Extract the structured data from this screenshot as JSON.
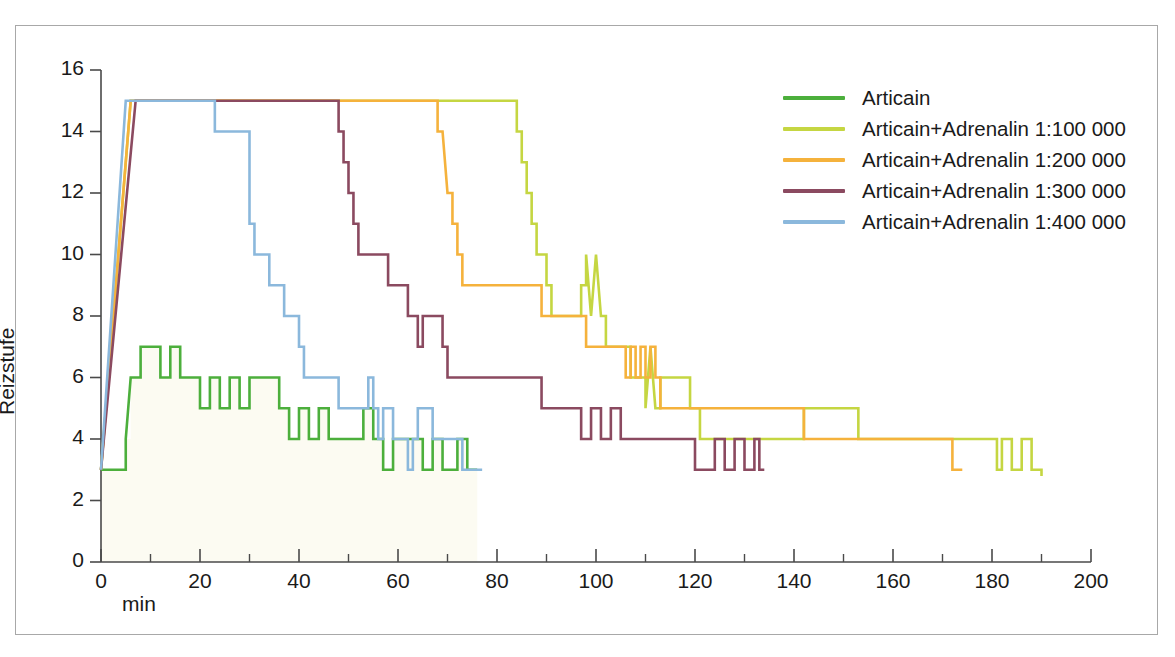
{
  "chart_data": {
    "type": "line",
    "title": "",
    "xlabel": "min",
    "ylabel": "Reizstufe",
    "xlim": [
      0,
      200
    ],
    "ylim": [
      0,
      16
    ],
    "xticks": [
      0,
      20,
      40,
      60,
      80,
      100,
      120,
      140,
      160,
      180,
      200
    ],
    "yticks": [
      0,
      2,
      4,
      6,
      8,
      10,
      12,
      14,
      16
    ],
    "xtick_labels": [
      "0",
      "20",
      "40",
      "60",
      "80",
      "100",
      "120",
      "140",
      "160",
      "180",
      "200"
    ],
    "ytick_labels": [
      "0",
      "2",
      "4",
      "6",
      "8",
      "10",
      "12",
      "14",
      "16"
    ],
    "x_minor_tick_step": 10,
    "grid": false,
    "legend_position": "upper-right",
    "series": [
      {
        "name": "Articain",
        "color": "#4CAF3C",
        "points": [
          [
            0,
            3
          ],
          [
            4,
            3
          ],
          [
            5,
            4
          ],
          [
            6,
            6
          ],
          [
            7,
            6
          ],
          [
            8,
            7
          ],
          [
            11,
            7
          ],
          [
            12,
            6
          ],
          [
            13,
            6
          ],
          [
            14,
            7
          ],
          [
            15,
            7
          ],
          [
            16,
            6
          ],
          [
            19,
            6
          ],
          [
            20,
            5
          ],
          [
            21,
            5
          ],
          [
            22,
            6
          ],
          [
            23,
            6
          ],
          [
            24,
            5
          ],
          [
            25,
            5
          ],
          [
            26,
            6
          ],
          [
            27,
            6
          ],
          [
            28,
            5
          ],
          [
            29,
            5
          ],
          [
            30,
            6
          ],
          [
            35,
            6
          ],
          [
            36,
            5
          ],
          [
            37,
            5
          ],
          [
            38,
            4
          ],
          [
            39,
            4
          ],
          [
            40,
            5
          ],
          [
            41,
            5
          ],
          [
            42,
            4
          ],
          [
            43,
            4
          ],
          [
            44,
            5
          ],
          [
            45,
            5
          ],
          [
            46,
            4
          ],
          [
            52,
            4
          ],
          [
            53,
            5
          ],
          [
            54,
            5
          ],
          [
            55,
            4
          ],
          [
            56,
            4
          ],
          [
            57,
            3
          ],
          [
            58,
            3
          ],
          [
            59,
            4
          ],
          [
            64,
            4
          ],
          [
            65,
            3
          ],
          [
            66,
            3
          ],
          [
            67,
            4
          ],
          [
            68,
            4
          ],
          [
            69,
            3
          ],
          [
            71,
            3
          ],
          [
            72,
            4
          ],
          [
            73,
            4
          ],
          [
            74,
            3
          ],
          [
            76,
            3
          ]
        ]
      },
      {
        "name": "Articain+Adrenalin 1:100 000",
        "color": "#C5D642",
        "points": [
          [
            0,
            3
          ],
          [
            6,
            15
          ],
          [
            83,
            15
          ],
          [
            84,
            14
          ],
          [
            85,
            13
          ],
          [
            86,
            12
          ],
          [
            87,
            11
          ],
          [
            88,
            10
          ],
          [
            89,
            10
          ],
          [
            90,
            9
          ],
          [
            91,
            8
          ],
          [
            96,
            8
          ],
          [
            97,
            9
          ],
          [
            98,
            10
          ],
          [
            99,
            8
          ],
          [
            100,
            10
          ],
          [
            101,
            8
          ],
          [
            102,
            7
          ],
          [
            106,
            7
          ],
          [
            107,
            6
          ],
          [
            109,
            6
          ],
          [
            110,
            5
          ],
          [
            111,
            7
          ],
          [
            112,
            5
          ],
          [
            113,
            6
          ],
          [
            118,
            6
          ],
          [
            119,
            5
          ],
          [
            120,
            5
          ],
          [
            121,
            4
          ],
          [
            141,
            4
          ],
          [
            142,
            5
          ],
          [
            152,
            5
          ],
          [
            153,
            4
          ],
          [
            180,
            4
          ],
          [
            181,
            3
          ],
          [
            182,
            4
          ],
          [
            183,
            4
          ],
          [
            184,
            3
          ],
          [
            185,
            3
          ],
          [
            186,
            4
          ],
          [
            187,
            4
          ],
          [
            188,
            3
          ],
          [
            190,
            2.8
          ]
        ]
      },
      {
        "name": "Articain+Adrenalin 1:200 000",
        "color": "#F5B23C",
        "points": [
          [
            0,
            3
          ],
          [
            6,
            15
          ],
          [
            67,
            15
          ],
          [
            68,
            14
          ],
          [
            69,
            14
          ],
          [
            70,
            12
          ],
          [
            71,
            11
          ],
          [
            72,
            10
          ],
          [
            73,
            9
          ],
          [
            74,
            9
          ],
          [
            88,
            9
          ],
          [
            89,
            8
          ],
          [
            97,
            8
          ],
          [
            98,
            7
          ],
          [
            99,
            7
          ],
          [
            100,
            7
          ],
          [
            105,
            7
          ],
          [
            106,
            6
          ],
          [
            107,
            7
          ],
          [
            108,
            6
          ],
          [
            109,
            7
          ],
          [
            110,
            6
          ],
          [
            111,
            7
          ],
          [
            112,
            6
          ],
          [
            113,
            5
          ],
          [
            118,
            5
          ],
          [
            119,
            5
          ],
          [
            120,
            5
          ],
          [
            141,
            5
          ],
          [
            142,
            4
          ],
          [
            171,
            4
          ],
          [
            172,
            3
          ],
          [
            174,
            3
          ]
        ]
      },
      {
        "name": "Articain+Adrenalin 1:300 000",
        "color": "#8B4A60",
        "points": [
          [
            0,
            3
          ],
          [
            7,
            15
          ],
          [
            47,
            15
          ],
          [
            48,
            14
          ],
          [
            49,
            13
          ],
          [
            50,
            12
          ],
          [
            51,
            11
          ],
          [
            52,
            10
          ],
          [
            53,
            10
          ],
          [
            57,
            10
          ],
          [
            58,
            9
          ],
          [
            59,
            9
          ],
          [
            61,
            9
          ],
          [
            62,
            8
          ],
          [
            63,
            8
          ],
          [
            64,
            7
          ],
          [
            65,
            8
          ],
          [
            66,
            8
          ],
          [
            68,
            8
          ],
          [
            69,
            7
          ],
          [
            70,
            6
          ],
          [
            77,
            6
          ],
          [
            78,
            6
          ],
          [
            79,
            6
          ],
          [
            88,
            6
          ],
          [
            89,
            5
          ],
          [
            96,
            5
          ],
          [
            97,
            4
          ],
          [
            98,
            4
          ],
          [
            99,
            5
          ],
          [
            100,
            5
          ],
          [
            101,
            4
          ],
          [
            102,
            4
          ],
          [
            103,
            5
          ],
          [
            104,
            5
          ],
          [
            105,
            4
          ],
          [
            119,
            4
          ],
          [
            120,
            3
          ],
          [
            123,
            3
          ],
          [
            124,
            4
          ],
          [
            125,
            4
          ],
          [
            126,
            3
          ],
          [
            127,
            3
          ],
          [
            128,
            4
          ],
          [
            129,
            4
          ],
          [
            130,
            3
          ],
          [
            131,
            3
          ],
          [
            132,
            4
          ],
          [
            133,
            3
          ],
          [
            134,
            3
          ]
        ]
      },
      {
        "name": "Articain+Adrenalin 1:400 000",
        "color": "#8BB8DC",
        "points": [
          [
            0,
            3
          ],
          [
            5,
            15
          ],
          [
            22,
            15
          ],
          [
            23,
            14
          ],
          [
            30,
            11
          ],
          [
            31,
            10
          ],
          [
            33,
            10
          ],
          [
            34,
            9
          ],
          [
            36,
            9
          ],
          [
            37,
            8
          ],
          [
            39,
            8
          ],
          [
            40,
            7
          ],
          [
            41,
            6
          ],
          [
            46,
            6
          ],
          [
            47,
            6
          ],
          [
            48,
            5
          ],
          [
            53,
            5
          ],
          [
            54,
            6
          ],
          [
            55,
            5
          ],
          [
            56,
            4
          ],
          [
            57,
            5
          ],
          [
            58,
            5
          ],
          [
            59,
            4
          ],
          [
            60,
            4
          ],
          [
            61,
            4
          ],
          [
            62,
            3
          ],
          [
            63,
            4
          ],
          [
            64,
            5
          ],
          [
            65,
            5
          ],
          [
            66,
            5
          ],
          [
            67,
            4
          ],
          [
            68,
            4
          ],
          [
            69,
            4
          ],
          [
            70,
            4
          ],
          [
            72,
            4
          ],
          [
            73,
            3
          ],
          [
            77,
            3
          ]
        ]
      }
    ]
  },
  "legend": {
    "items": [
      {
        "label": "Articain",
        "color": "#4CAF3C"
      },
      {
        "label": "Articain+Adrenalin 1:100 000",
        "color": "#C5D642"
      },
      {
        "label": "Articain+Adrenalin 1:200 000",
        "color": "#F5B23C"
      },
      {
        "label": "Articain+Adrenalin 1:300 000",
        "color": "#8B4A60"
      },
      {
        "label": "Articain+Adrenalin 1:400 000",
        "color": "#8BB8DC"
      }
    ]
  },
  "axes": {
    "y_title": "Reizstufe",
    "x_title": "min"
  },
  "colors": {
    "axis": "#4a4a4a",
    "frame": "#a8a8a8",
    "text": "#1a1a1a",
    "fill_tint": "#fbfaf0"
  }
}
